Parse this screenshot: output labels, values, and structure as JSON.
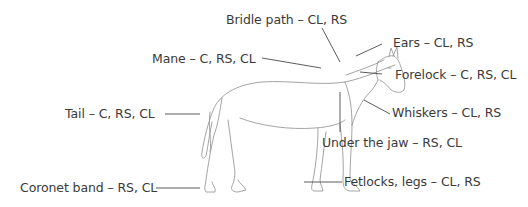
{
  "diagram": {
    "colors": {
      "text": "#3a3a3a",
      "leader_line": "#4a4a4a",
      "outline": "#9a9a9a",
      "background": "#ffffff"
    },
    "labels": [
      {
        "id": "bridle-path",
        "text": "Bridle path – CL, RS"
      },
      {
        "id": "mane",
        "text": "Mane – C, RS, CL"
      },
      {
        "id": "ears",
        "text": "Ears – CL, RS"
      },
      {
        "id": "forelock",
        "text": "Forelock – C, RS, CL"
      },
      {
        "id": "tail",
        "text": "Tail – C, RS, CL"
      },
      {
        "id": "whiskers",
        "text": "Whiskers – CL, RS"
      },
      {
        "id": "under-the-jaw",
        "text": "Under the jaw – RS, CL"
      },
      {
        "id": "coronet-band",
        "text": "Coronet band – RS, CL"
      },
      {
        "id": "fetlocks-legs",
        "text": "Fetlocks, legs – CL, RS"
      }
    ]
  }
}
